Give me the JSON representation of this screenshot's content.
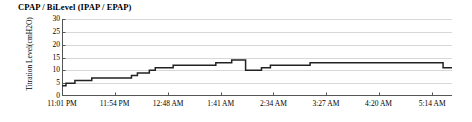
{
  "chart_data": {
    "type": "line",
    "title": "CPAP / BiLevel (IPAP / EPAP)",
    "subtitle": "",
    "xlabel": "",
    "ylabel": "Titration Level (cmH2O)",
    "ylabel_line1": "Titration Level",
    "ylabel_line2": "(cmH2O)",
    "ylim": [
      0,
      30
    ],
    "yticks": [
      0,
      5,
      10,
      15,
      20,
      25,
      30
    ],
    "ytick_labels": [
      "0",
      "5",
      "10",
      "15",
      "20",
      "25",
      "30"
    ],
    "xtick_labels": [
      "11:01 PM",
      "11:54 PM",
      "12:48 AM",
      "1:41 AM",
      "2:34 AM",
      "3:27 AM",
      "4:20 AM",
      "5:14 AM"
    ],
    "xlim_minutes": [
      0,
      393
    ],
    "xtick_minutes": [
      0,
      53,
      107,
      160,
      213,
      266,
      319,
      373
    ],
    "grid": "horizontal",
    "legend": "none",
    "line_color": "#222222",
    "grid_color": "#d8d8d8",
    "axis_color": "#555555",
    "step_style": "post",
    "series": [
      {
        "name": "CPAP / BiLevel Titration Level",
        "x_minutes": [
          0,
          4,
          8,
          13,
          18,
          24,
          30,
          38,
          46,
          53,
          62,
          70,
          76,
          82,
          88,
          94,
          100,
          106,
          112,
          118,
          124,
          130,
          136,
          142,
          148,
          155,
          163,
          171,
          178,
          185,
          193,
          201,
          210,
          222,
          235,
          250,
          268,
          290,
          315,
          340,
          360,
          375,
          384,
          393
        ],
        "values": [
          4,
          5,
          5,
          6,
          6,
          6,
          7,
          7,
          7,
          7,
          7,
          8,
          9,
          9,
          10,
          11,
          11,
          11,
          12,
          12,
          12,
          12,
          12,
          12,
          12,
          13,
          13,
          14,
          14,
          10,
          10,
          11,
          12,
          12,
          12,
          13,
          13,
          13,
          13,
          13,
          13,
          13,
          11,
          11
        ]
      }
    ]
  }
}
